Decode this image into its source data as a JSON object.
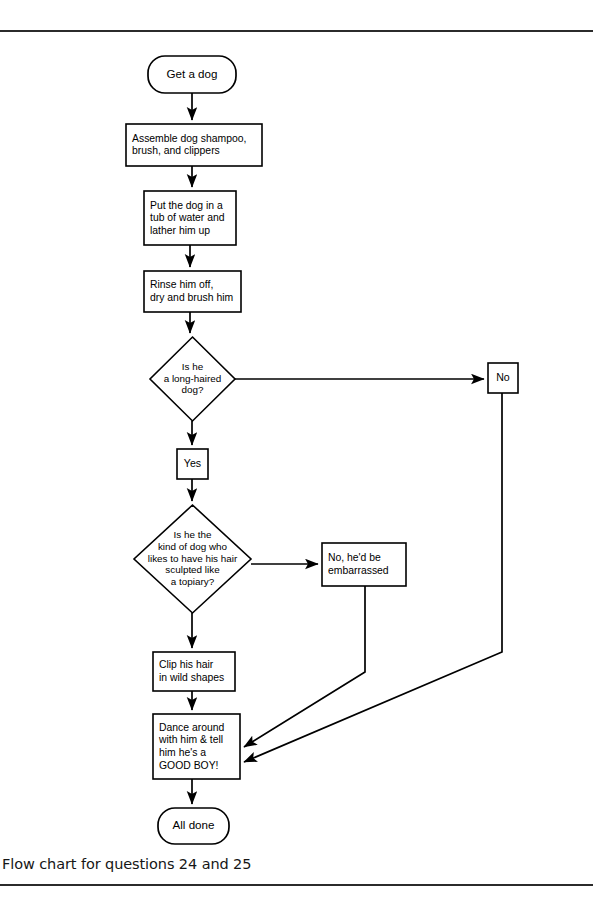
{
  "page": {
    "caption": "Flow chart for questions 24 and 25",
    "rule_color": "#2b2b2b",
    "background": "#ffffff",
    "line_color": "#000000"
  },
  "chart_data": {
    "type": "diagram",
    "diagram_kind": "flowchart",
    "title": "Flow chart for questions 24 and 25",
    "nodes": [
      {
        "id": "start",
        "shape": "terminator",
        "lines": [
          "Get a dog"
        ],
        "x": 148,
        "y": 56,
        "w": 88,
        "h": 37,
        "align": "center"
      },
      {
        "id": "assemble",
        "shape": "rect",
        "lines": [
          "Assemble dog shampoo,",
          "brush, and clippers"
        ],
        "x": 126,
        "y": 124,
        "w": 136,
        "h": 42,
        "align": "left"
      },
      {
        "id": "bathe",
        "shape": "rect",
        "lines": [
          "Put the dog in a",
          "tub of water and",
          "lather him up"
        ],
        "x": 144,
        "y": 191,
        "w": 92,
        "h": 54,
        "align": "left"
      },
      {
        "id": "rinse",
        "shape": "rect",
        "lines": [
          "Rinse him off,",
          "dry and brush him"
        ],
        "x": 144,
        "y": 271,
        "w": 97,
        "h": 41,
        "align": "left"
      },
      {
        "id": "decision-longhair",
        "shape": "diamond",
        "lines": [
          "Is he",
          "a long-haired",
          "dog?"
        ],
        "x": 150,
        "y": 337,
        "w": 85,
        "h": 84,
        "align": "center"
      },
      {
        "id": "answer-no",
        "shape": "rect",
        "lines": [
          "No"
        ],
        "x": 488,
        "y": 363,
        "w": 30,
        "h": 30,
        "align": "center"
      },
      {
        "id": "answer-yes",
        "shape": "rect",
        "lines": [
          "Yes"
        ],
        "x": 177,
        "y": 449,
        "w": 31,
        "h": 30,
        "align": "center"
      },
      {
        "id": "decision-topiary",
        "shape": "diamond",
        "lines": [
          "Is he the",
          "kind of dog who",
          "likes to have his hair",
          "sculpted like",
          "a topiary?"
        ],
        "x": 134,
        "y": 505,
        "w": 117,
        "h": 108,
        "align": "center"
      },
      {
        "id": "answer-embarrassed",
        "shape": "rect",
        "lines": [
          "No, he'd be",
          "embarrassed"
        ],
        "x": 322,
        "y": 543,
        "w": 84,
        "h": 43,
        "align": "left"
      },
      {
        "id": "clip",
        "shape": "rect",
        "lines": [
          "Clip his hair",
          "in wild shapes"
        ],
        "x": 153,
        "y": 652,
        "w": 82,
        "h": 39,
        "align": "left"
      },
      {
        "id": "dance",
        "shape": "rect",
        "lines": [
          "Dance around",
          "with him & tell",
          "him he's a",
          "GOOD BOY!"
        ],
        "x": 153,
        "y": 714,
        "w": 87,
        "h": 65,
        "align": "left"
      },
      {
        "id": "end",
        "shape": "terminator",
        "lines": [
          "All done"
        ],
        "x": 158,
        "y": 808,
        "w": 71,
        "h": 36,
        "align": "center"
      }
    ],
    "edges": [
      {
        "id": "start-to-assemble",
        "from": "start",
        "to": "assemble",
        "points": "192,93 192,120",
        "arrow": "down"
      },
      {
        "id": "assemble-to-bathe",
        "from": "assemble",
        "to": "bathe",
        "points": "192,166 192,187",
        "arrow": "down"
      },
      {
        "id": "bathe-to-rinse",
        "from": "bathe",
        "to": "rinse",
        "points": "190,245 190,267",
        "arrow": "down"
      },
      {
        "id": "rinse-to-decision",
        "from": "rinse",
        "to": "decision-longhair",
        "points": "190,312 190,333",
        "arrow": "down"
      },
      {
        "id": "decision-to-no",
        "from": "decision-longhair",
        "to": "answer-no",
        "points": "235,379 484,379",
        "arrow": "right"
      },
      {
        "id": "decision-to-yes",
        "from": "decision-longhair",
        "to": "answer-yes",
        "points": "192,421 192,445",
        "arrow": "down"
      },
      {
        "id": "yes-to-topiary",
        "from": "answer-yes",
        "to": "decision-topiary",
        "points": "192,479 192,501",
        "arrow": "down"
      },
      {
        "id": "topiary-to-embarrassed",
        "from": "decision-topiary",
        "to": "answer-embarrassed",
        "points": "251,564 318,564",
        "arrow": "right"
      },
      {
        "id": "topiary-to-clip",
        "from": "decision-topiary",
        "to": "clip",
        "points": "192,613 192,648",
        "arrow": "down"
      },
      {
        "id": "clip-to-dance",
        "from": "clip",
        "to": "dance",
        "points": "192,691 192,710",
        "arrow": "down"
      },
      {
        "id": "embarrassed-to-dance",
        "from": "answer-embarrassed",
        "to": "dance",
        "points": "365,586 365,672 244,747",
        "arrow": "left-diagonal"
      },
      {
        "id": "no-to-dance",
        "from": "answer-no",
        "to": "dance",
        "points": "502,393 502,652 244,762",
        "arrow": "left-diagonal"
      },
      {
        "id": "dance-to-end",
        "from": "dance",
        "to": "end",
        "points": "192,779 192,804",
        "arrow": "down"
      }
    ],
    "decision_labels": {
      "longhair_yes": "Yes",
      "longhair_no": "No",
      "topiary_no": "No, he'd be embarrassed"
    }
  }
}
